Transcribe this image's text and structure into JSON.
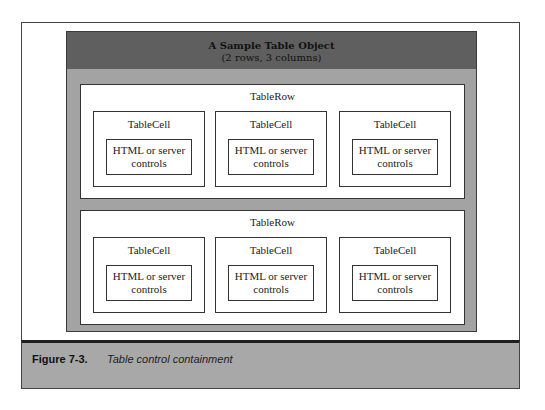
{
  "table_object": {
    "title": "A Sample Table Object",
    "subtitle": "(2 rows, 3 columns)"
  },
  "rows": [
    {
      "label": "TableRow",
      "cells": [
        {
          "label": "TableCell",
          "content_line1": "HTML or server",
          "content_line2": "controls"
        },
        {
          "label": "TableCell",
          "content_line1": "HTML or server",
          "content_line2": "controls"
        },
        {
          "label": "TableCell",
          "content_line1": "HTML or server",
          "content_line2": "controls"
        }
      ]
    },
    {
      "label": "TableRow",
      "cells": [
        {
          "label": "TableCell",
          "content_line1": "HTML or server",
          "content_line2": "controls"
        },
        {
          "label": "TableCell",
          "content_line1": "HTML or server",
          "content_line2": "controls"
        },
        {
          "label": "TableCell",
          "content_line1": "HTML or server",
          "content_line2": "controls"
        }
      ]
    }
  ],
  "caption": {
    "figure_number": "Figure 7-3.",
    "text": "Table control containment"
  },
  "colors": {
    "header": "#5f5f5f",
    "table_body": "#a3a3a3",
    "caption_bar": "#a8a8a8"
  }
}
